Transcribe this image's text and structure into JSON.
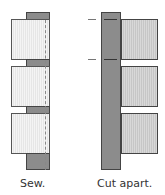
{
  "figures": [
    {
      "id": "sew",
      "caption": "Sew."
    },
    {
      "id": "cut",
      "caption": "Cut apart."
    }
  ],
  "colors": {
    "strip_dark": "#8c8c8c",
    "square_light": "#eeeeee",
    "square_cut": "#cfcfcf",
    "outline": "#444444"
  }
}
